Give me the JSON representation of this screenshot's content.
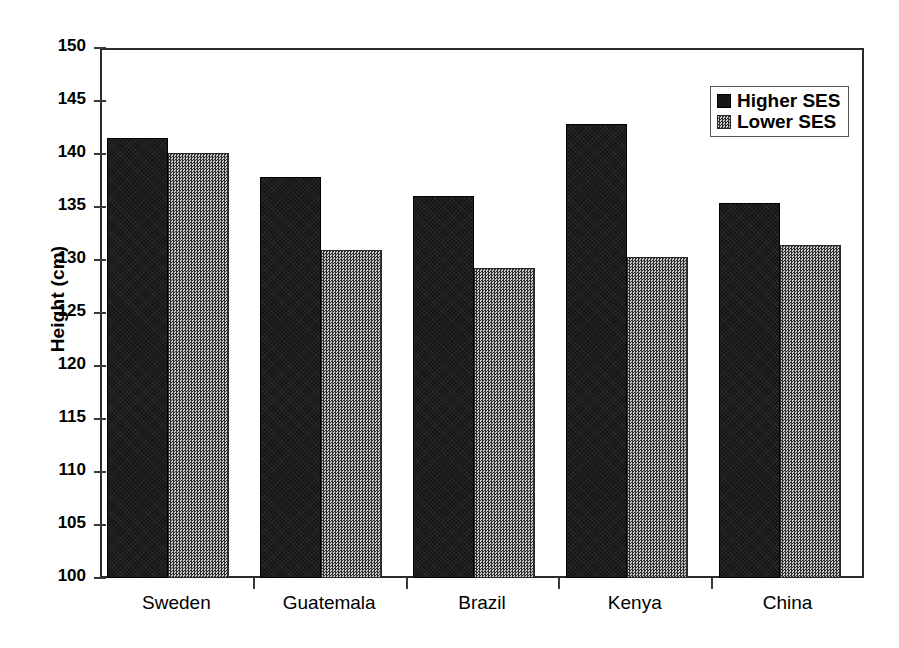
{
  "chart_data": {
    "type": "bar",
    "title": "",
    "xlabel": "",
    "ylabel": "Height (cm)",
    "categories": [
      "Sweden",
      "Guatemala",
      "Brazil",
      "Kenya",
      "China"
    ],
    "series": [
      {
        "name": "Higher SES",
        "color": "#161616",
        "values": [
          141.5,
          137.8,
          136.0,
          142.8,
          135.4
        ]
      },
      {
        "name": "Lower SES",
        "color": "#7a7a7a",
        "values": [
          140.1,
          130.9,
          129.2,
          130.3,
          131.4
        ]
      }
    ],
    "ylim": [
      100,
      150
    ],
    "ytick_step": 5,
    "ytick_labels": [
      "150",
      "145",
      "140",
      "135",
      "130",
      "125",
      "120",
      "115",
      "110",
      "105",
      "100"
    ],
    "grid": false,
    "legend_position": "top-right"
  },
  "legend": {
    "entries": [
      {
        "label": "Higher SES",
        "swatch": "higher"
      },
      {
        "label": "Lower SES",
        "swatch": "lower"
      }
    ]
  }
}
